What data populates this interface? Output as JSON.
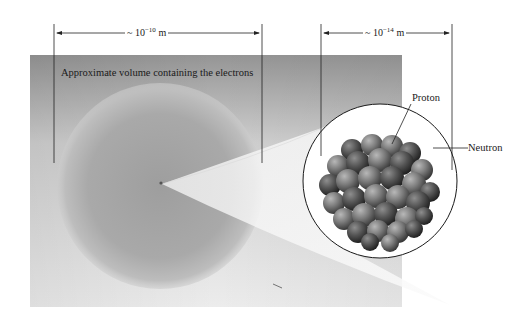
{
  "figure": {
    "electron_cloud_label": "Approximate volume containing the electrons",
    "atom_dimension": {
      "prefix": "~ 10",
      "exponent": "−10",
      "unit": " m"
    },
    "nucleus_dimension": {
      "prefix": "~ 10",
      "exponent": "−14",
      "unit": " m"
    },
    "particle_labels": {
      "proton": "Proton",
      "neutron": "Neutron"
    }
  },
  "colors": {
    "panel_top": "#9a9a9a",
    "panel_bottom": "#e8e8e8",
    "sphere": "#a8a8a8",
    "cone": "#f2f2f2",
    "nucleon_dark": "#3c3c3c",
    "nucleon_light": "#8a8a8a",
    "line": "#222222"
  }
}
